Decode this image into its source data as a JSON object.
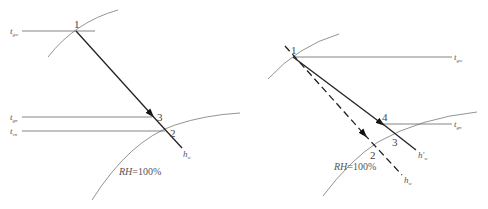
{
  "diagrams": [
    {
      "id": "left",
      "point_labels": {
        "p1": "1",
        "p2": "2",
        "p3": "3"
      },
      "temp_labels": {
        "top": {
          "base": "t",
          "sub": "gw"
        },
        "mid": {
          "base": "t",
          "sub": "gn"
        },
        "bottom": {
          "base": "t",
          "sub": "vn"
        }
      },
      "line_label": {
        "base": "h",
        "sub": "w"
      },
      "curve_label": {
        "italic": "RH",
        "rest": "=100%"
      }
    },
    {
      "id": "right",
      "point_labels": {
        "p1": "1",
        "p2": "2",
        "p3": "3",
        "p4": "4"
      },
      "temp_labels": {
        "top": {
          "base": "t",
          "sub": "gw"
        },
        "mid": {
          "base": "t",
          "sub": "gn"
        }
      },
      "solid_line_label": {
        "base": "h",
        "prime": "′",
        "sub": "w"
      },
      "dashed_line_label": {
        "base": "h",
        "sub": "w"
      },
      "curve_label": {
        "italic": "RH",
        "rest": "=100%"
      }
    }
  ],
  "colors": {
    "line": "#222222",
    "thin": "#666666",
    "text": "#555555"
  }
}
